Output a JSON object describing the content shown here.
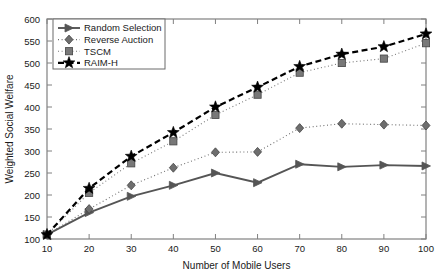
{
  "chart_data": {
    "type": "line",
    "title": "",
    "xlabel": "Number of Mobile Users",
    "ylabel": "Weighted Social Welfare",
    "x": [
      10,
      20,
      30,
      40,
      50,
      60,
      70,
      80,
      90,
      100
    ],
    "xlim": [
      10,
      100
    ],
    "ylim": [
      100,
      600
    ],
    "xticks": [
      10,
      20,
      30,
      40,
      50,
      60,
      70,
      80,
      90,
      100
    ],
    "yticks": [
      100,
      150,
      200,
      250,
      300,
      350,
      400,
      450,
      500,
      550,
      600
    ],
    "grid": false,
    "legend_position": "top-left",
    "series": [
      {
        "name": "Random Selection",
        "marker": "right-triangle",
        "line_style": "solid",
        "color": "#555555",
        "values": [
          110,
          160,
          197,
          222,
          250,
          228,
          270,
          264,
          268,
          266
        ]
      },
      {
        "name": "Reverse Auction",
        "marker": "diamond",
        "line_style": "dotted",
        "color": "#6e6e6e",
        "values": [
          110,
          168,
          222,
          262,
          297,
          298,
          352,
          362,
          360,
          358
        ]
      },
      {
        "name": "TSCM",
        "marker": "square",
        "line_style": "dotted",
        "color": "#787878",
        "values": [
          110,
          205,
          272,
          322,
          382,
          428,
          478,
          500,
          510,
          545
        ]
      },
      {
        "name": "RAIM-H",
        "marker": "star",
        "line_style": "dashed",
        "color": "#000000",
        "values": [
          110,
          215,
          288,
          342,
          400,
          445,
          492,
          520,
          537,
          566
        ]
      }
    ]
  },
  "axes": {
    "x_label": "Number of Mobile Users",
    "y_label": "Weighted Social Welfare",
    "x_tick_labels": [
      "10",
      "20",
      "30",
      "40",
      "50",
      "60",
      "70",
      "80",
      "90",
      "100"
    ],
    "y_tick_labels": [
      "100",
      "150",
      "200",
      "250",
      "300",
      "350",
      "400",
      "450",
      "500",
      "550",
      "600"
    ]
  },
  "legend": {
    "entries": [
      {
        "label": "Random Selection"
      },
      {
        "label": "Reverse Auction"
      },
      {
        "label": "TSCM"
      },
      {
        "label": "RAIM-H"
      }
    ]
  }
}
